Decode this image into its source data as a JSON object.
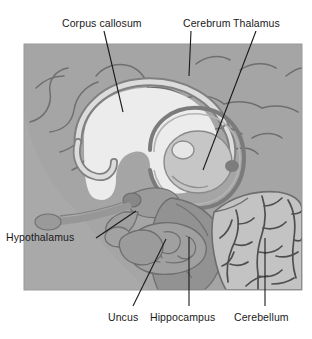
{
  "figure": {
    "background_color": "#ffffff",
    "plate_color": "#a8a8a8",
    "plate": {
      "x": 24,
      "y": 44,
      "width": 278,
      "height": 246
    }
  },
  "labels": {
    "corpus_callosum": "Corpus callosum",
    "cerebrum": "Cerebrum",
    "thalamus": "Thalamus",
    "hypothalamus": "Hypothalamus",
    "uncus": "Uncus",
    "hippocampus": "Hippocampus",
    "cerebellum": "Cerebellum"
  },
  "structures": [
    {
      "name": "cerebrum",
      "fill": "#a3a3a3",
      "description": "cerebral cortex with sulci"
    },
    {
      "name": "corpus-callosum",
      "fill": "#d8d8d8",
      "description": "light arched band above thalamus"
    },
    {
      "name": "lateral-ventricle",
      "fill": "#efefef",
      "description": "light crescent within cerebrum"
    },
    {
      "name": "thalamus",
      "fill": "#c9c9c9",
      "description": "central oval encircled by fornix ring"
    },
    {
      "name": "hypothalamus",
      "fill": "#9a9a9a",
      "description": "stalk below thalamus with optic chiasm"
    },
    {
      "name": "uncus",
      "fill": "#9e9e9e",
      "description": "rounded medial temporal bulge"
    },
    {
      "name": "hippocampus",
      "fill": "#a0a0a0",
      "description": "nodular mass in temporal lobe"
    },
    {
      "name": "cerebellum",
      "fill": "#c4c4c4",
      "description": "foliated mass with arbor vitae branching"
    },
    {
      "name": "brainstem",
      "fill": "#8f8f8f",
      "description": "midbrain, pons and medulla column"
    },
    {
      "name": "olfactory-tract",
      "fill": "#9c9c9c",
      "description": "bulb and tract projecting anteriorly"
    }
  ],
  "leaders": [
    {
      "name": "corpus-callosum",
      "x1": 104,
      "y1": 31,
      "x2": 123,
      "y2": 112
    },
    {
      "name": "cerebrum",
      "x1": 191,
      "y1": 31,
      "x2": 189,
      "y2": 76
    },
    {
      "name": "thalamus",
      "x1": 256,
      "y1": 31,
      "x2": 203,
      "y2": 170
    },
    {
      "name": "hypothalamus",
      "x1": 96,
      "y1": 238,
      "x2": 136,
      "y2": 211
    },
    {
      "name": "uncus",
      "x1": 133,
      "y1": 306,
      "x2": 166,
      "y2": 239
    },
    {
      "name": "hippocampus",
      "x1": 189,
      "y1": 306,
      "x2": 189,
      "y2": 237
    },
    {
      "name": "cerebellum",
      "x1": 265,
      "y1": 306,
      "x2": 265,
      "y2": 238
    }
  ],
  "colors": {
    "line": "#1a1a1a",
    "outline": "#6d6d6d",
    "text": "#1a1a1a"
  }
}
